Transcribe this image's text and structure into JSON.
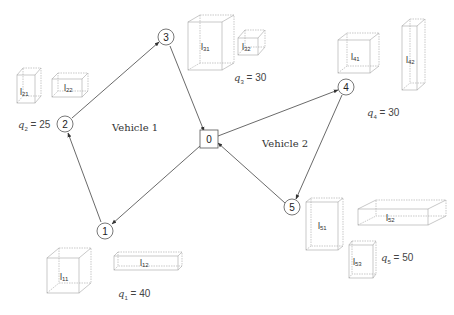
{
  "diagram": {
    "depot": {
      "id": "0",
      "x": 209,
      "y": 139
    },
    "customers": [
      {
        "id": "1",
        "x": 105,
        "y": 231,
        "demand_label": "q",
        "demand_sub": "1",
        "demand_value": "= 40",
        "items": [
          "l11",
          "l12"
        ]
      },
      {
        "id": "2",
        "x": 65,
        "y": 124,
        "demand_label": "q",
        "demand_sub": "2",
        "demand_value": "= 25",
        "items": [
          "l21",
          "l22"
        ]
      },
      {
        "id": "3",
        "x": 167,
        "y": 37,
        "demand_label": "q",
        "demand_sub": "3",
        "demand_value": "= 30",
        "items": [
          "l31",
          "l32"
        ]
      },
      {
        "id": "4",
        "x": 346,
        "y": 87,
        "demand_label": "q",
        "demand_sub": "4",
        "demand_value": "= 30",
        "items": [
          "l41",
          "l42"
        ]
      },
      {
        "id": "5",
        "x": 292,
        "y": 207,
        "demand_label": "q",
        "demand_sub": "5",
        "demand_value": "= 50",
        "items": [
          "l51",
          "l52",
          "l53"
        ]
      }
    ],
    "vehicles": [
      {
        "label": "Vehicle 1",
        "route": [
          "0",
          "1",
          "2",
          "3",
          "0"
        ]
      },
      {
        "label": "Vehicle 2",
        "route": [
          "0",
          "4",
          "5",
          "0"
        ]
      }
    ],
    "colors": {
      "line": "#444444",
      "box": "#9a9a9a",
      "text": "#333333"
    }
  },
  "labels": {
    "vehicle1": "Vehicle 1",
    "vehicle2": "Vehicle 2",
    "q1": {
      "sym": "q",
      "sub": "1",
      "val": " = 40"
    },
    "q2": {
      "sym": "q",
      "sub": "2",
      "val": " = 25"
    },
    "q3": {
      "sym": "q",
      "sub": "3",
      "val": " = 30"
    },
    "q4": {
      "sym": "q",
      "sub": "4",
      "val": " = 30"
    },
    "q5": {
      "sym": "q",
      "sub": "5",
      "val": " = 50"
    },
    "node0": "0",
    "node1": "1",
    "node2": "2",
    "node3": "3",
    "node4": "4",
    "node5": "5",
    "items": {
      "l11": {
        "base": "l",
        "sub": "11"
      },
      "l12": {
        "base": "l",
        "sub": "12"
      },
      "l21": {
        "base": "l",
        "sub": "21"
      },
      "l22": {
        "base": "l",
        "sub": "22"
      },
      "l31": {
        "base": "l",
        "sub": "31"
      },
      "l32": {
        "base": "l",
        "sub": "32"
      },
      "l41": {
        "base": "l",
        "sub": "41"
      },
      "l42": {
        "base": "l",
        "sub": "42"
      },
      "l51": {
        "base": "l",
        "sub": "51"
      },
      "l52": {
        "base": "l",
        "sub": "52"
      },
      "l53": {
        "base": "l",
        "sub": "53"
      }
    }
  }
}
